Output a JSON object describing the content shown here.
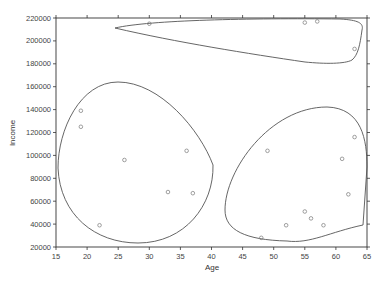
{
  "chart_data": {
    "type": "scatter",
    "title": "",
    "xlabel": "Age",
    "ylabel": "Income",
    "xlim": [
      15,
      65
    ],
    "ylim": [
      20000,
      220000
    ],
    "x_ticks": [
      15,
      20,
      25,
      30,
      35,
      40,
      45,
      50,
      55,
      60,
      65
    ],
    "y_ticks": [
      20000,
      40000,
      60000,
      80000,
      100000,
      120000,
      140000,
      160000,
      180000,
      200000,
      220000
    ],
    "grid": false,
    "legend": null,
    "series": [
      {
        "name": "cluster-left",
        "points": [
          {
            "x": 19,
            "y": 139000
          },
          {
            "x": 19,
            "y": 125000
          },
          {
            "x": 26,
            "y": 96000
          },
          {
            "x": 36,
            "y": 104000
          },
          {
            "x": 33,
            "y": 68000
          },
          {
            "x": 37,
            "y": 67000
          },
          {
            "x": 22,
            "y": 39000
          }
        ]
      },
      {
        "name": "cluster-right",
        "points": [
          {
            "x": 49,
            "y": 104000
          },
          {
            "x": 63,
            "y": 116000
          },
          {
            "x": 61,
            "y": 97000
          },
          {
            "x": 62,
            "y": 66000
          },
          {
            "x": 55,
            "y": 51000
          },
          {
            "x": 56,
            "y": 45000
          },
          {
            "x": 52,
            "y": 39000
          },
          {
            "x": 58,
            "y": 39000
          },
          {
            "x": 48,
            "y": 28000
          }
        ]
      },
      {
        "name": "cluster-top",
        "points": [
          {
            "x": 30,
            "y": 215000
          },
          {
            "x": 55,
            "y": 216000
          },
          {
            "x": 57,
            "y": 217000
          },
          {
            "x": 63,
            "y": 193000
          }
        ]
      }
    ],
    "annotations": "Each cluster of points is enclosed by a hand-drawn closed curve outline"
  },
  "colors": {
    "axis": "#333333",
    "points": "#777777",
    "outline": "#555555"
  }
}
